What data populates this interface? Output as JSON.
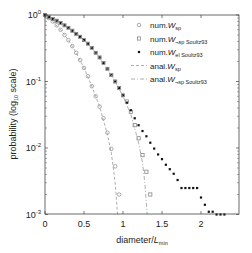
{
  "chart_data": {
    "type": "scatter",
    "title": "",
    "xlabel": "diameter/L_min",
    "xlabel_main": "diameter/",
    "xlabel_var": "L",
    "xlabel_sub": "min",
    "ylabel": "probability (log10 scale)",
    "ylabel_pre": "probability (log",
    "ylabel_sub": "10",
    "ylabel_post": " scale)",
    "xlim": [
      0,
      2.45
    ],
    "ylim": [
      0.001,
      1
    ],
    "yscale": "log",
    "grid": false,
    "legend_position": "upper right",
    "x_ticks": [
      0,
      0.5,
      1,
      1.5,
      2
    ],
    "x_tick_labels": [
      "0",
      "0.5",
      "1",
      "1.5",
      "2"
    ],
    "y_ticks": [
      1,
      0.1,
      0.01,
      0.001
    ],
    "y_tick_labels": [
      {
        "base": "10",
        "exp": "0"
      },
      {
        "base": "10",
        "exp": "-1"
      },
      {
        "base": "10",
        "exp": "-2"
      },
      {
        "base": "10",
        "exp": "-3"
      }
    ],
    "series": [
      {
        "name": "num.W_sp",
        "legend_prefix": "num.",
        "legend_var": "W",
        "legend_sub": "sp",
        "marker": "circle-open",
        "color": "#888888",
        "x": [
          0,
          0.05,
          0.1,
          0.15,
          0.2,
          0.25,
          0.3,
          0.35,
          0.4,
          0.45,
          0.5,
          0.55,
          0.6,
          0.65,
          0.7,
          0.75,
          0.8,
          0.85,
          0.9,
          0.95
        ],
        "y": [
          1,
          0.9,
          0.8,
          0.7,
          0.6,
          0.5,
          0.42,
          0.34,
          0.27,
          0.21,
          0.16,
          0.12,
          0.085,
          0.06,
          0.042,
          0.028,
          0.017,
          0.0097,
          0.0053,
          0.002
        ]
      },
      {
        "name": "num.W_¬sp Soultz93",
        "legend_prefix": "num.",
        "legend_var": "W",
        "legend_sub": "¬sp Soultz93",
        "marker": "square-open",
        "color": "#777777",
        "x": [
          0,
          0.05,
          0.1,
          0.15,
          0.2,
          0.25,
          0.3,
          0.35,
          0.4,
          0.45,
          0.5,
          0.55,
          0.6,
          0.65,
          0.7,
          0.75,
          0.8,
          0.85,
          0.9,
          0.95,
          1.0,
          1.05,
          1.1,
          1.15,
          1.2,
          1.25,
          1.3,
          1.35
        ],
        "y": [
          1,
          0.93,
          0.87,
          0.82,
          0.76,
          0.7,
          0.64,
          0.58,
          0.52,
          0.47,
          0.42,
          0.37,
          0.32,
          0.27,
          0.23,
          0.19,
          0.155,
          0.125,
          0.1,
          0.08,
          0.062,
          0.05,
          0.035,
          0.022,
          0.014,
          0.0078,
          0.0044,
          0.002
        ]
      },
      {
        "name": "num.W_el Soultz93",
        "legend_prefix": "num.",
        "legend_var": "W",
        "legend_sub": "el Soultz93",
        "marker": "square-filled",
        "color": "#111111",
        "x": [
          0,
          0.05,
          0.1,
          0.15,
          0.2,
          0.25,
          0.3,
          0.35,
          0.4,
          0.45,
          0.5,
          0.55,
          0.6,
          0.65,
          0.7,
          0.75,
          0.8,
          0.85,
          0.9,
          0.95,
          1.0,
          1.05,
          1.1,
          1.15,
          1.2,
          1.25,
          1.3,
          1.35,
          1.4,
          1.45,
          1.5,
          1.55,
          1.6,
          1.65,
          1.7,
          1.75,
          1.8,
          1.85,
          1.9,
          1.95,
          2.0,
          2.05,
          2.1,
          2.15,
          2.2,
          2.25,
          2.3
        ],
        "y": [
          1,
          0.93,
          0.87,
          0.82,
          0.76,
          0.7,
          0.64,
          0.58,
          0.52,
          0.47,
          0.42,
          0.37,
          0.32,
          0.27,
          0.23,
          0.19,
          0.155,
          0.125,
          0.1,
          0.08,
          0.062,
          0.048,
          0.037,
          0.028,
          0.022,
          0.018,
          0.015,
          0.012,
          0.0098,
          0.008,
          0.0068,
          0.0056,
          0.0048,
          0.0041,
          0.0033,
          0.0025,
          0.0025,
          0.0025,
          0.0025,
          0.0025,
          0.0018,
          0.0014,
          0.0011,
          0.0011,
          0.001,
          0.001,
          0.001
        ]
      },
      {
        "name": "anal.W_sp",
        "legend_prefix": "anal.",
        "legend_var": "W",
        "legend_sub": "sp",
        "marker": "dashed-line",
        "color": "#999999",
        "x": [
          0,
          0.1,
          0.2,
          0.3,
          0.4,
          0.5,
          0.6,
          0.7,
          0.8,
          0.85,
          0.9,
          0.93
        ],
        "y": [
          1,
          0.8,
          0.6,
          0.42,
          0.27,
          0.16,
          0.085,
          0.042,
          0.016,
          0.0085,
          0.003,
          0.001
        ]
      },
      {
        "name": "anal.W_¬sp Soultz93",
        "legend_prefix": "anal.",
        "legend_var": "W",
        "legend_sub": "¬sp Soultz93",
        "marker": "dashdot-line",
        "color": "#999999",
        "x": [
          0,
          0.2,
          0.4,
          0.6,
          0.8,
          0.9,
          1.0,
          1.1,
          1.2,
          1.25,
          1.28,
          1.31
        ],
        "y": [
          1,
          0.76,
          0.52,
          0.32,
          0.155,
          0.1,
          0.06,
          0.032,
          0.012,
          0.006,
          0.003,
          0.001
        ]
      }
    ]
  }
}
